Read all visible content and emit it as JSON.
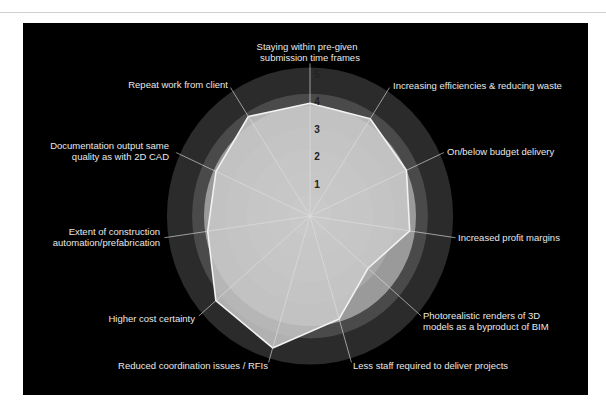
{
  "chart_data": {
    "type": "radar",
    "title": "",
    "axes": [
      "Staying within pre-given submission time frames",
      "Increasing efficiencies & reducing waste",
      "On/below budget delivery",
      "Increased profit margins",
      "Photorealistic renders of 3D models as a byproduct of BIM",
      "Less staff required to deliver projects",
      "Reduced coordination issues / RFIs",
      "Higher cost certainty",
      "Extent of construction automation/prefabrication",
      "Documentation output same quality as with 2D CAD",
      "Repeat work from client"
    ],
    "axis_label_lines": [
      [
        "Staying within pre-given",
        "submission time frames"
      ],
      [
        "Increasing efficiencies & reducing waste"
      ],
      [
        "On/below budget delivery"
      ],
      [
        "Increased profit margins"
      ],
      [
        "Photorealistic renders of 3D",
        "models as a byproduct of BIM"
      ],
      [
        "Less staff required to deliver projects"
      ],
      [
        "Reduced coordination issues / RFIs"
      ],
      [
        "Higher cost certainty"
      ],
      [
        "Extent of construction",
        "automation/prefabrication"
      ],
      [
        "Documentation output same",
        "quality as with 2D CAD"
      ],
      [
        "Repeat work from client"
      ]
    ],
    "series": [
      {
        "name": "Ratings",
        "values": [
          4.1,
          4.2,
          4.0,
          3.8,
          2.9,
          3.9,
          5.0,
          4.7,
          3.9,
          3.9,
          4.3
        ]
      }
    ],
    "radial_ticks": [
      "1",
      "2",
      "3",
      "4",
      "5"
    ],
    "rmax": 5.4,
    "grid": true,
    "legend": "none",
    "colors": {
      "background": "#000000",
      "band_outer": "#2b2b2b",
      "band_mid": "#4a4a4a",
      "band_inner": [
        "#9a9a9a",
        "#a8a8a8",
        "#b3b3b3",
        "#bdbdbd",
        "#c6c6c6"
      ],
      "polygon_fill": "#c9c9c9",
      "polygon_stroke": "#f2f2f2",
      "spoke": "#e0e0e0",
      "label": "#e8e8e8",
      "tick": "#222222"
    }
  }
}
